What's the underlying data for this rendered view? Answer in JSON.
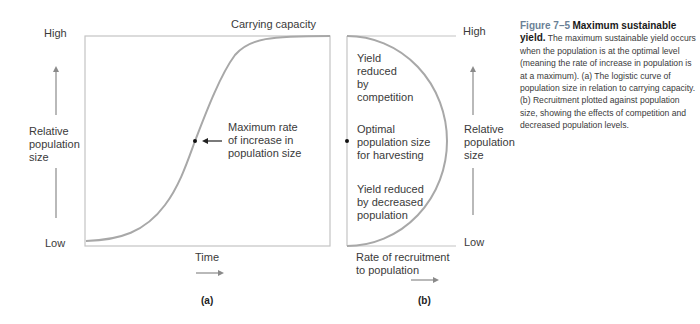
{
  "panel_a": {
    "y_high": "High",
    "y_low": "Low",
    "y_axis_label": [
      "Relative",
      "population",
      "size"
    ],
    "top_label": "Carrying capacity",
    "annotation": [
      "Maximum rate",
      "of increase in",
      "population size"
    ],
    "x_axis_label": "Time",
    "panel_label": "(a)"
  },
  "panel_b": {
    "y_high": "High",
    "y_low": "Low",
    "y_axis_label": [
      "Relative",
      "population",
      "size"
    ],
    "region_top": [
      "Yield",
      "reduced",
      "by",
      "competition"
    ],
    "region_mid": [
      "Optimal",
      "population size",
      "for harvesting"
    ],
    "region_bottom": [
      "Yield reduced",
      "by decreased",
      "population"
    ],
    "x_axis_label": [
      "Rate of recruitment",
      "to population"
    ],
    "panel_label": "(b)"
  },
  "caption": {
    "figure_number": "Figure 7–5",
    "title": "Maximum sustainable yield.",
    "body": "The maximum sustainable yield occurs when the population is at the optimal level (meaning the rate of increase in population is at a maximum). (a) The logistic curve of population size in relation to carrying capacity. (b) Recruitment plotted against population size, showing the effects of competition and decreased population levels."
  },
  "colors": {
    "curve": "#a8a8a8",
    "axis": "#b8b8b8",
    "arrow": "#8a8a8a",
    "figure_label": "#6a7f96"
  }
}
